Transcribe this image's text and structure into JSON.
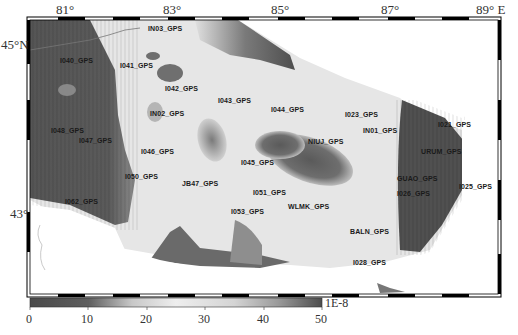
{
  "map": {
    "longitude_ticks": [
      {
        "label": "81°",
        "x": 63
      },
      {
        "label": "83°",
        "x": 170
      },
      {
        "label": "85°",
        "x": 278
      },
      {
        "label": "87°",
        "x": 388
      },
      {
        "label": "89° E",
        "x": 483
      }
    ],
    "latitude_ticks": [
      {
        "label": "45°N",
        "y": 44
      },
      {
        "label": "43°",
        "y": 211
      }
    ],
    "stations": [
      {
        "name": "IN03_GPS",
        "x": 148,
        "y": 25
      },
      {
        "name": "I040_GPS",
        "x": 60,
        "y": 57
      },
      {
        "name": "I041_GPS",
        "x": 120,
        "y": 62
      },
      {
        "name": "I042_GPS",
        "x": 165,
        "y": 85
      },
      {
        "name": "I043_GPS",
        "x": 218,
        "y": 97
      },
      {
        "name": "I044_GPS",
        "x": 271,
        "y": 106
      },
      {
        "name": "I023_GPS",
        "x": 345,
        "y": 111
      },
      {
        "name": "IN02_GPS",
        "x": 150,
        "y": 110
      },
      {
        "name": "I021_GPS",
        "x": 438,
        "y": 121
      },
      {
        "name": "IN01_GPS",
        "x": 363,
        "y": 127
      },
      {
        "name": "I048_GPS",
        "x": 51,
        "y": 127
      },
      {
        "name": "I047_GPS",
        "x": 79,
        "y": 137
      },
      {
        "name": "NIUJ_GPS",
        "x": 308,
        "y": 138
      },
      {
        "name": "I046_GPS",
        "x": 141,
        "y": 148
      },
      {
        "name": "URUM_GPS",
        "x": 421,
        "y": 148
      },
      {
        "name": "I045_GPS",
        "x": 241,
        "y": 159
      },
      {
        "name": "I050_GPS",
        "x": 125,
        "y": 173
      },
      {
        "name": "GUAO_GPS",
        "x": 397,
        "y": 175
      },
      {
        "name": "JB47_GPS",
        "x": 182,
        "y": 180
      },
      {
        "name": "I025_GPS",
        "x": 459,
        "y": 183
      },
      {
        "name": "I051_GPS",
        "x": 253,
        "y": 189
      },
      {
        "name": "I026_GPS",
        "x": 397,
        "y": 190
      },
      {
        "name": "I062_GPS",
        "x": 65,
        "y": 198
      },
      {
        "name": "WLMK_GPS",
        "x": 288,
        "y": 203
      },
      {
        "name": "I053_GPS",
        "x": 231,
        "y": 208
      },
      {
        "name": "BALN_GPS",
        "x": 350,
        "y": 228
      },
      {
        "name": "I028_GPS",
        "x": 353,
        "y": 259
      }
    ]
  },
  "colorbar": {
    "ticks": [
      "0",
      "10",
      "20",
      "30",
      "40",
      "50"
    ],
    "unit": "1E-8",
    "min": 0,
    "max": 50
  }
}
